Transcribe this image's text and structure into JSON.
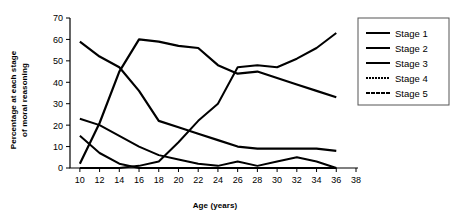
{
  "chart_data": {
    "type": "line",
    "title": "",
    "xlabel": "Age (years)",
    "ylabel": "Percentage at each stage of moral reasoning",
    "ylabel_line1": "Percentage at each stage",
    "ylabel_line2": "of moral reasoning",
    "xlim": [
      9,
      38
    ],
    "ylim": [
      0,
      70
    ],
    "grid": false,
    "legend_position": "right",
    "x": [
      10,
      12,
      14,
      16,
      18,
      20,
      22,
      24,
      26,
      28,
      30,
      32,
      34,
      36
    ],
    "xticks": [
      10,
      12,
      14,
      16,
      18,
      20,
      22,
      24,
      26,
      28,
      30,
      32,
      34,
      36,
      38
    ],
    "xtick_labels": [
      "10",
      "12",
      "14",
      "16",
      "18",
      "20",
      "22",
      "24",
      "26",
      "28",
      "30",
      "32",
      "34",
      "36",
      "38"
    ],
    "yticks": [
      0,
      10,
      20,
      30,
      40,
      50,
      60,
      70
    ],
    "ytick_labels": [
      "0",
      "10",
      "20",
      "30",
      "40",
      "50",
      "60",
      "70"
    ],
    "series": [
      {
        "name": "Stage 1",
        "values": [
          15,
          7,
          2,
          0,
          0,
          0,
          0,
          0,
          0,
          0,
          0,
          0,
          0,
          0
        ],
        "stroke_width": 2.0,
        "dash": "none"
      },
      {
        "name": "Stage 2",
        "values": [
          23,
          20,
          15,
          10,
          6,
          4,
          2,
          1,
          3,
          1,
          3,
          5,
          3,
          0
        ],
        "stroke_width": 2.0,
        "dash": "none"
      },
      {
        "name": "Stage 3",
        "values": [
          59,
          52,
          47,
          36,
          22,
          19,
          16,
          13,
          10,
          9,
          9,
          9,
          9,
          8
        ],
        "stroke_width": 2.2,
        "dash": "none"
      },
      {
        "name": "Stage 4",
        "values": [
          2,
          21,
          45,
          60,
          59,
          57,
          56,
          48,
          44,
          45,
          42,
          39,
          36,
          33
        ],
        "stroke_width": 2.2,
        "dash": "none"
      },
      {
        "name": "Stage 5",
        "values": [
          0,
          0,
          0,
          1,
          3,
          12,
          22,
          30,
          47,
          48,
          47,
          51,
          56,
          63
        ],
        "stroke_width": 2.0,
        "dash": "none"
      }
    ],
    "legend_entries": [
      {
        "label": "Stage 1",
        "dash": "none"
      },
      {
        "label": "Stage 2",
        "dash": "none"
      },
      {
        "label": "Stage 3",
        "dash": "none"
      },
      {
        "label": "Stage 4",
        "dash": "2 1"
      },
      {
        "label": "Stage 5",
        "dash": "4 1"
      }
    ],
    "colors": {
      "line": "#000000",
      "axis": "#000000",
      "background": "#ffffff",
      "legend_border": "#555555"
    }
  }
}
